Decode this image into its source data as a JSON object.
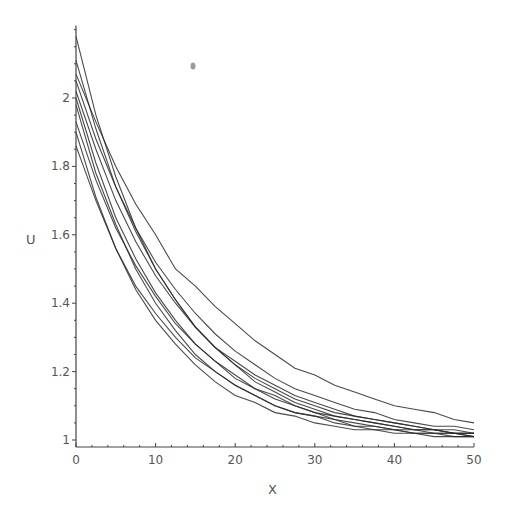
{
  "chart_data": {
    "type": "line",
    "title": "",
    "xlabel": "X",
    "ylabel": "U",
    "xlim": [
      0,
      50
    ],
    "ylim": [
      1,
      2.2
    ],
    "grid": false,
    "legend": null,
    "x_ticks": [
      0,
      10,
      20,
      30,
      40,
      50
    ],
    "x_tick_labels": [
      "0",
      "10",
      "20",
      "30",
      "40",
      "50"
    ],
    "y_ticks": [
      1,
      1.2,
      1.4,
      1.6,
      1.8,
      2
    ],
    "y_tick_labels": [
      "1",
      "1.2",
      "1.4",
      "1.6",
      "1.8",
      "2"
    ],
    "x": [
      0,
      2.5,
      5,
      7.5,
      10,
      12.5,
      15,
      17.5,
      20,
      22.5,
      25,
      27.5,
      30,
      32.5,
      35,
      37.5,
      40,
      42.5,
      45,
      47.5,
      50
    ],
    "series": [
      {
        "name": "curve-1",
        "values": [
          2.18,
          1.95,
          1.77,
          1.62,
          1.5,
          1.41,
          1.33,
          1.27,
          1.22,
          1.17,
          1.14,
          1.11,
          1.09,
          1.07,
          1.06,
          1.05,
          1.04,
          1.03,
          1.03,
          1.02,
          1.02
        ]
      },
      {
        "name": "curve-2",
        "values": [
          2.11,
          1.91,
          1.74,
          1.61,
          1.5,
          1.41,
          1.33,
          1.27,
          1.22,
          1.18,
          1.15,
          1.12,
          1.1,
          1.08,
          1.07,
          1.06,
          1.05,
          1.04,
          1.03,
          1.02,
          1.02
        ]
      },
      {
        "name": "curve-3",
        "values": [
          2.07,
          1.93,
          1.8,
          1.69,
          1.6,
          1.5,
          1.45,
          1.39,
          1.34,
          1.29,
          1.25,
          1.21,
          1.19,
          1.16,
          1.14,
          1.12,
          1.1,
          1.09,
          1.08,
          1.06,
          1.05
        ]
      },
      {
        "name": "curve-4",
        "values": [
          2.02,
          1.85,
          1.7,
          1.58,
          1.48,
          1.4,
          1.33,
          1.27,
          1.23,
          1.19,
          1.16,
          1.13,
          1.11,
          1.09,
          1.07,
          1.06,
          1.05,
          1.04,
          1.03,
          1.03,
          1.02
        ]
      },
      {
        "name": "curve-5",
        "values": [
          2.0,
          1.81,
          1.65,
          1.53,
          1.43,
          1.35,
          1.28,
          1.23,
          1.18,
          1.15,
          1.12,
          1.1,
          1.08,
          1.06,
          1.05,
          1.04,
          1.03,
          1.03,
          1.02,
          1.02,
          1.01
        ]
      },
      {
        "name": "curve-6",
        "values": [
          1.98,
          1.78,
          1.63,
          1.5,
          1.4,
          1.32,
          1.25,
          1.2,
          1.16,
          1.13,
          1.1,
          1.08,
          1.07,
          1.05,
          1.04,
          1.03,
          1.03,
          1.02,
          1.02,
          1.01,
          1.01
        ]
      },
      {
        "name": "curve-7",
        "values": [
          1.93,
          1.76,
          1.62,
          1.51,
          1.42,
          1.34,
          1.28,
          1.23,
          1.19,
          1.15,
          1.13,
          1.1,
          1.08,
          1.07,
          1.06,
          1.05,
          1.04,
          1.03,
          1.03,
          1.02,
          1.02
        ]
      },
      {
        "name": "curve-8",
        "values": [
          1.9,
          1.71,
          1.56,
          1.44,
          1.35,
          1.28,
          1.22,
          1.17,
          1.13,
          1.11,
          1.08,
          1.07,
          1.05,
          1.04,
          1.03,
          1.03,
          1.02,
          1.02,
          1.01,
          1.01,
          1.01
        ]
      },
      {
        "name": "curve-9",
        "values": [
          1.86,
          1.7,
          1.56,
          1.45,
          1.37,
          1.3,
          1.24,
          1.2,
          1.16,
          1.13,
          1.1,
          1.08,
          1.07,
          1.06,
          1.04,
          1.04,
          1.03,
          1.02,
          1.02,
          1.02,
          1.01
        ]
      },
      {
        "name": "curve-10",
        "values": [
          2.05,
          1.88,
          1.74,
          1.62,
          1.52,
          1.44,
          1.37,
          1.31,
          1.26,
          1.22,
          1.18,
          1.15,
          1.13,
          1.11,
          1.09,
          1.08,
          1.06,
          1.05,
          1.04,
          1.04,
          1.03
        ]
      }
    ]
  },
  "plot_area": {
    "x0_px": 76,
    "x_scale_px_per_unit": 7.96,
    "y_base_px": 440,
    "y_scale_px_per_unit": 342,
    "x_axis_y_px": 447,
    "y_axis_x_px": 76
  },
  "labels": {
    "x_axis": "X",
    "y_axis": "U"
  }
}
